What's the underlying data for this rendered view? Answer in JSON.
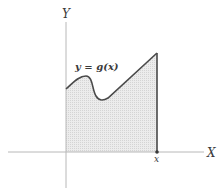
{
  "diagram": {
    "axis_labels": {
      "x": "X",
      "y": "Y"
    },
    "curve_label": "y = g(x)",
    "point_label": "x",
    "colors": {
      "axis": "#b8b8b8",
      "curve": "#4a4a4a",
      "fill": "#e6e6e6",
      "text": "#3a3a3a"
    }
  }
}
